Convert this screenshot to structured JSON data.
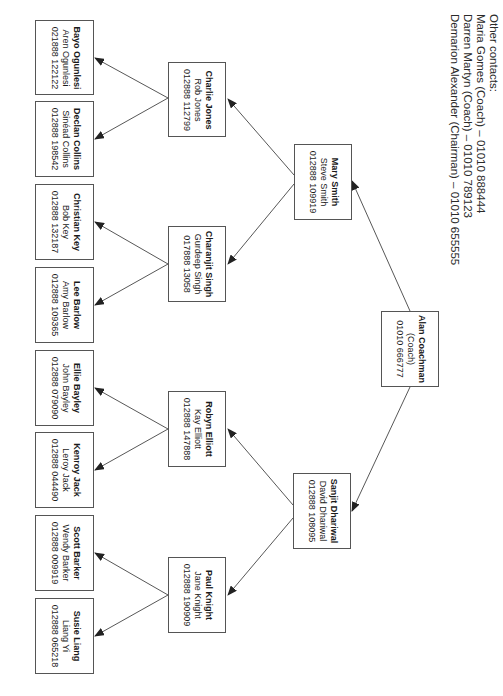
{
  "other_contacts": {
    "heading": "Other contacts:",
    "items": [
      "Maria Gomes (Coach) – 01010 888444",
      "Darren Martyn (Coach) – 01010 789123",
      "Demarion Alexander (Chairman) –  01010 655555"
    ]
  },
  "tree": {
    "root": {
      "name": "Alan Coachman",
      "role": "(Coach)",
      "phone": "01010 666777"
    },
    "level2": [
      {
        "name": "Mary Smith",
        "contact": "Steve Smith",
        "phone": "012888 109919"
      },
      {
        "name": "Sanjit Dhariwal",
        "contact": "David Dhariwal",
        "phone": "012888 108095"
      }
    ],
    "level3": [
      {
        "name": "Charlie Jones",
        "contact": "Rob Jones",
        "phone": "012888 112799"
      },
      {
        "name": "Charanjit Singh",
        "contact": "Gurdeep Singh",
        "phone": "017888 13058"
      },
      {
        "name": "Robyn Elliott",
        "contact": "Kay Elliott",
        "phone": "012888 147888"
      },
      {
        "name": "Paul Knight",
        "contact": "Jane Knight",
        "phone": "012888 190909"
      }
    ],
    "level4": [
      {
        "name": "Bayo Ogunlesi",
        "contact": "Aren Ogunlesi",
        "phone": "021888 122122"
      },
      {
        "name": "Declan Collins",
        "contact": "Sinéad Collins",
        "phone": "012888 198542"
      },
      {
        "name": "Christian Key",
        "contact": "Bob Key",
        "phone": "012888 132187"
      },
      {
        "name": "Lee Barlow",
        "contact": "Amy Barlow",
        "phone": "012888 109365"
      },
      {
        "name": "Ellie Bayley",
        "contact": "John Bayley",
        "phone": "012888 079090"
      },
      {
        "name": "Kenroy Jack",
        "contact": "Leroy Jack",
        "phone": "012888 044490"
      },
      {
        "name": "Scott Barker",
        "contact": "Wendy Barker",
        "phone": "012888 009919"
      },
      {
        "name": "Susie Liang",
        "contact": "Liang Yi",
        "phone": "012888 065218"
      }
    ]
  },
  "colors": {
    "line": "#444444",
    "border": "#555555",
    "background": "#ffffff"
  }
}
